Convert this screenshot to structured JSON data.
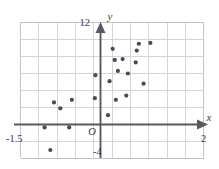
{
  "chart_data": {
    "type": "scatter",
    "title": "",
    "subtitle": "",
    "xlabel": "x",
    "ylabel": "y",
    "xlim": [
      -1.5,
      2.0
    ],
    "ylim": [
      -4,
      12
    ],
    "grid": true,
    "legend": null,
    "origin_label": "O",
    "tick_labels": {
      "x_min": "-1.5",
      "x_max": "2",
      "y_min": "-4",
      "y_max": "12"
    },
    "grid_step_x": 0.35,
    "grid_step_y": 2,
    "point_count": 22,
    "points": [
      {
        "x": -0.93,
        "y": -3.0
      },
      {
        "x": -1.04,
        "y": -0.35
      },
      {
        "x": -0.57,
        "y": -0.35
      },
      {
        "x": -0.86,
        "y": 2.6
      },
      {
        "x": -0.74,
        "y": 1.9
      },
      {
        "x": -0.52,
        "y": 2.9
      },
      {
        "x": -0.08,
        "y": 3.1
      },
      {
        "x": -0.07,
        "y": 5.8
      },
      {
        "x": 0.2,
        "y": 5.1
      },
      {
        "x": 0.32,
        "y": 2.9
      },
      {
        "x": 0.17,
        "y": 1.1
      },
      {
        "x": 0.36,
        "y": 6.3
      },
      {
        "x": 0.3,
        "y": 7.6
      },
      {
        "x": 0.45,
        "y": 7.7
      },
      {
        "x": 0.55,
        "y": 6.0
      },
      {
        "x": 0.26,
        "y": 8.9
      },
      {
        "x": 0.7,
        "y": 7.3
      },
      {
        "x": 0.72,
        "y": 8.7
      },
      {
        "x": 0.76,
        "y": 9.5
      },
      {
        "x": 0.98,
        "y": 9.6
      },
      {
        "x": 0.52,
        "y": 3.4
      },
      {
        "x": 0.85,
        "y": 4.8
      }
    ]
  },
  "figure": {
    "name": "scatter-plot-figure"
  }
}
